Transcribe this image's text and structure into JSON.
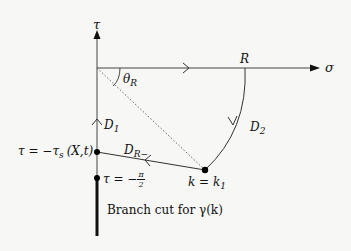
{
  "diagram": {
    "type": "complex-plane contour",
    "axes": {
      "vertical_label": "τ",
      "horizontal_label": "σ"
    },
    "labels": {
      "theta": "θ",
      "theta_sub": "R",
      "R": "R",
      "D1": "D",
      "D1_sub": "1",
      "D2": "D",
      "D2_sub": "2",
      "DR": "D",
      "DR_sub": "R−",
      "tau_s_eq": "τ = −τ",
      "tau_s_sub": "s",
      "tau_s_args": "(X,t)",
      "tau_pi_eq": "τ = −",
      "pi_num": "π",
      "pi_den": "2",
      "k_eq": "k = k",
      "k_sub": "1",
      "branch_cut": "Branch cut for γ(k)"
    },
    "colors": {
      "line": "#333333",
      "dot": "#000000",
      "dotted": "#555555",
      "background": "#f7f7f5"
    }
  }
}
